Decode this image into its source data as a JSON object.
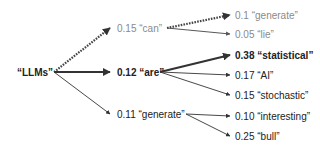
{
  "diagram": {
    "title": "",
    "colors": {
      "primary": "#333333",
      "muted": "#8a8a8a"
    },
    "root": {
      "id": "root",
      "label": "“LLMs”",
      "emphasis": "bold"
    },
    "level1": [
      {
        "id": "can",
        "prob": "0.15",
        "token": "“can”",
        "style": "muted",
        "edge": "dotted",
        "emphasis": "normal"
      },
      {
        "id": "are",
        "prob": "0.12",
        "token": "“are”",
        "style": "primary",
        "edge": "thick",
        "emphasis": "bold"
      },
      {
        "id": "generate",
        "prob": "0.11",
        "token": "“generate”",
        "style": "primary",
        "edge": "thin",
        "emphasis": "normal"
      }
    ],
    "level2": [
      {
        "parent": "can",
        "prob": "0.1",
        "token": "“generate”",
        "style": "muted",
        "edge": "dotted",
        "emphasis": "normal"
      },
      {
        "parent": "can",
        "prob": "0.05",
        "token": "“lie”",
        "style": "muted",
        "edge": "thin",
        "emphasis": "normal"
      },
      {
        "parent": "are",
        "prob": "0.38",
        "token": "“statistical”",
        "style": "primary",
        "edge": "thick",
        "emphasis": "bold"
      },
      {
        "parent": "are",
        "prob": "0.17",
        "token": "“AI”",
        "style": "primary",
        "edge": "thin",
        "emphasis": "normal"
      },
      {
        "parent": "are",
        "prob": "0.15",
        "token": "“stochastic”",
        "style": "primary",
        "edge": "thin",
        "emphasis": "normal"
      },
      {
        "parent": "generate",
        "prob": "0.10",
        "token": "“interesting”",
        "style": "primary",
        "edge": "thin",
        "emphasis": "normal"
      },
      {
        "parent": "generate",
        "prob": "0.25",
        "token": "“bull”",
        "style": "primary",
        "edge": "thin",
        "emphasis": "normal"
      }
    ]
  }
}
